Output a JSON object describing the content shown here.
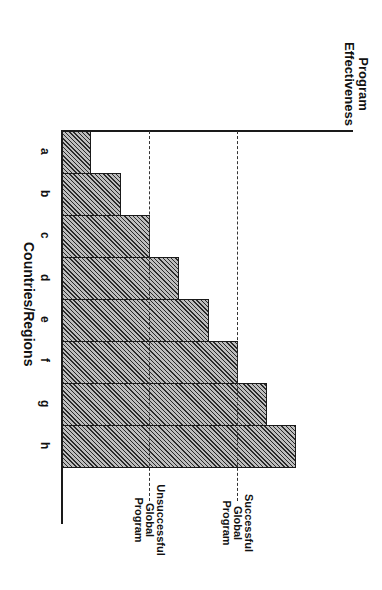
{
  "chart_data": {
    "type": "bar",
    "orientation": "vertical bars, image rotated 90deg clockwise",
    "title": "",
    "xlabel": "Countries/Regions",
    "ylabel": "Program Effectiveness",
    "categories": [
      "a",
      "b",
      "c",
      "d",
      "e",
      "f",
      "g",
      "h"
    ],
    "values": [
      1,
      2,
      3,
      4,
      5,
      6,
      7,
      8
    ],
    "ylim": [
      0,
      10
    ],
    "grid": false,
    "y_ticks_shown": false,
    "reference_lines": [
      {
        "label": "Unsuccessful Global Program",
        "value": 3,
        "style": "dashed"
      },
      {
        "label": "Successful Global Program",
        "value": 6,
        "style": "dashed"
      }
    ],
    "bar_fill": "diagonal hatch",
    "colors": {
      "bar_fill": "#8a8a8a",
      "bar_edge": "#1a1a1a",
      "axis": "#1a1a1a",
      "reference_line": "#333333"
    }
  },
  "labels": {
    "y_axis_line1": "Program",
    "y_axis_line2": "Effectiveness",
    "x_axis": "Countries/Regions",
    "ref_unsuccessful": [
      "Unsuccessful",
      "Global",
      "Program"
    ],
    "ref_successful": [
      "Successful",
      "Global",
      "Program"
    ]
  }
}
